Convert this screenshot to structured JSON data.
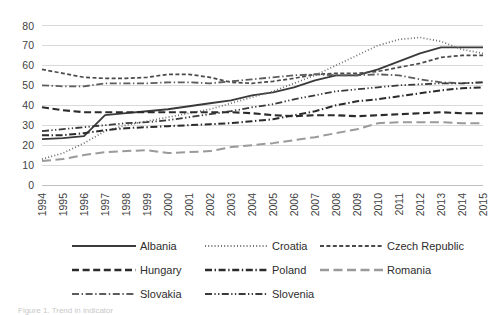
{
  "figure": {
    "caption": "Figure 1. Trend in indicator",
    "background": "#ffffff"
  },
  "chart_data": {
    "type": "line",
    "title": "",
    "subtitle": "",
    "xlabel": "",
    "ylabel": "",
    "xlim": [
      1994,
      2015
    ],
    "ylim": [
      0,
      80
    ],
    "yticks": [
      0,
      10,
      20,
      30,
      40,
      50,
      60,
      70,
      80
    ],
    "grid": true,
    "legend_position": "bottom",
    "x": [
      1994,
      1995,
      1996,
      1997,
      1998,
      1999,
      2000,
      2001,
      2002,
      2003,
      2004,
      2005,
      2006,
      2007,
      2008,
      2009,
      2010,
      2011,
      2012,
      2013,
      2014,
      2015
    ],
    "xticklabels": [
      "1994",
      "1995",
      "1996",
      "1997",
      "1998",
      "1999",
      "2000",
      "2001",
      "2002",
      "2003",
      "2004",
      "2005",
      "2006",
      "2007",
      "2008",
      "2009",
      "2010",
      "2011",
      "2012",
      "2013",
      "2014",
      "2015"
    ],
    "series": [
      {
        "name": "Albania",
        "color": "#3a3a3a",
        "dash": "none",
        "width": 1.8,
        "values": [
          23,
          23.5,
          24.5,
          35,
          36,
          37,
          38,
          39.5,
          41,
          42.5,
          45,
          46.5,
          49,
          52.5,
          55,
          55,
          58,
          62,
          66,
          69,
          69,
          69
        ]
      },
      {
        "name": "Croatia",
        "color": "#6e6e6e",
        "dash": "dotted",
        "width": 1.7,
        "values": [
          13,
          16,
          21,
          27,
          30,
          32,
          34,
          36,
          38,
          41,
          44,
          47,
          51,
          55,
          60,
          65,
          70,
          73,
          74,
          72,
          68,
          66
        ]
      },
      {
        "name": "Czech Republic",
        "color": "#4a4a4a",
        "dash": "short-dash",
        "width": 1.7,
        "values": [
          58,
          56,
          54,
          53.5,
          53.5,
          54,
          55.5,
          55.5,
          54,
          51.5,
          51,
          52,
          53.5,
          55.5,
          56,
          56,
          57,
          59,
          61,
          64,
          65,
          65
        ]
      },
      {
        "name": "Hungary",
        "color": "#2b2b2b",
        "dash": "dashed",
        "width": 2.1,
        "values": [
          39,
          37.5,
          36.5,
          36.5,
          36.5,
          36.5,
          36.5,
          36.5,
          36.5,
          36.5,
          36,
          35,
          34.5,
          35,
          35,
          34.5,
          35,
          35.5,
          36,
          36.5,
          36,
          36
        ]
      },
      {
        "name": "Poland",
        "color": "#2b2b2b",
        "dash": "dash-dot",
        "width": 2.0,
        "values": [
          25,
          25,
          26,
          27.5,
          28.5,
          29,
          29.5,
          30,
          30.5,
          31,
          32,
          33,
          35,
          37,
          40,
          42,
          43,
          44.5,
          46,
          47.5,
          48.5,
          49
        ]
      },
      {
        "name": "Romania",
        "color": "#9a9a9a",
        "dash": "long-dash",
        "width": 2.0,
        "values": [
          12,
          13,
          15,
          16.5,
          17,
          17.5,
          16,
          16.5,
          17,
          19,
          20,
          21,
          22.5,
          24,
          26,
          28,
          31,
          31.5,
          31.5,
          31.5,
          31,
          31
        ]
      },
      {
        "name": "Slovakia",
        "color": "#5c5c5c",
        "dash": "dash-dot",
        "width": 1.8,
        "values": [
          50,
          49.5,
          49.5,
          51,
          51,
          51,
          51.5,
          51.5,
          51,
          52,
          53,
          54,
          55,
          55.5,
          55,
          55,
          55.5,
          55,
          53,
          51.5,
          51,
          51.5
        ]
      },
      {
        "name": "Slovenia",
        "color": "#3a3a3a",
        "dash": "dash-dot-dot",
        "width": 1.8,
        "values": [
          27,
          28,
          29,
          30,
          31,
          31.5,
          32.5,
          34,
          35.5,
          37,
          39,
          40.5,
          43,
          45,
          47,
          48,
          49,
          50,
          50.5,
          51,
          51,
          51.5
        ]
      }
    ],
    "legend_rows": [
      [
        "Albania",
        "Croatia",
        "Czech Republic"
      ],
      [
        "Hungary",
        "Poland",
        "Romania"
      ],
      [
        "Slovakia",
        "Slovenia"
      ]
    ]
  }
}
